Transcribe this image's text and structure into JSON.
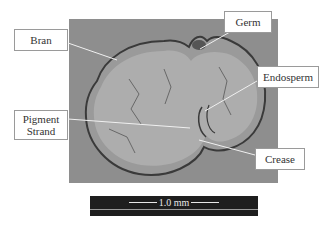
{
  "figure": {
    "labels": {
      "bran": "Bran",
      "germ": "Germ",
      "endosperm": "Endosperm",
      "pigment_strand_line1": "Pigment",
      "pigment_strand_line2": "Strand",
      "crease": "Crease"
    },
    "scale_bar": {
      "value": "1.0 mm"
    },
    "colors": {
      "background_photo": "#8e8e8e",
      "endosperm": "#a8a8a8",
      "bran_outline": "#3a3a3a",
      "leader_lines": "#f0f0f0",
      "scale_bar_bg": "#1e1e1e"
    }
  }
}
